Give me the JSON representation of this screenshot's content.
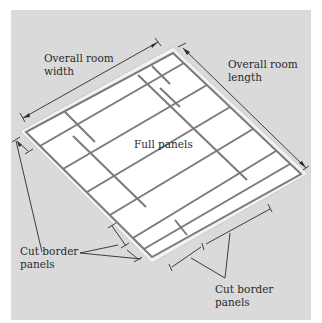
{
  "diagram": {
    "type": "isometric suspended ceiling layout",
    "labels": {
      "room_width": "Overall room\nwidth",
      "room_length": "Overall room\nlength",
      "full_panels": "Full panels",
      "cut_border_left": "Cut border\npanels",
      "cut_border_bottom": "Cut border\npanels"
    },
    "colors": {
      "background": "#dadada",
      "page": "#ffffff",
      "border_frame": "#efefef",
      "grid_line": "#7a7a7a",
      "panel_fill": "#ffffff",
      "dimension_line": "#2a2a2a",
      "text": "#2a2a2a"
    }
  }
}
